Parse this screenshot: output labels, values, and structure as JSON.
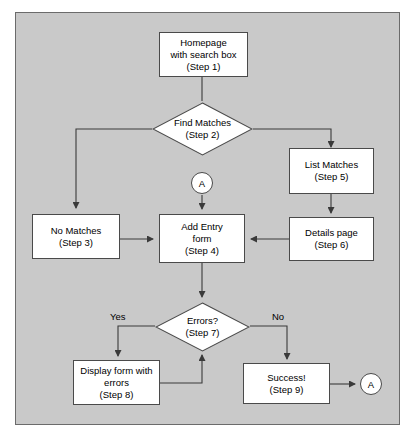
{
  "diagram": {
    "type": "flowchart",
    "background_color": "#c9c9c9",
    "node_fill_color": "#ffffff",
    "node_border_color": "#4a4a4a",
    "line_color": "#4a4a4a"
  },
  "nodes": {
    "homepage": {
      "shape": "process",
      "line1": "Homepage",
      "line2": "with search box",
      "line3": "(Step 1)"
    },
    "find_matches": {
      "shape": "decision",
      "line1": "Find Matches",
      "line2": "(Step 2)"
    },
    "connector_in": {
      "shape": "connector",
      "label": "A"
    },
    "list_matches": {
      "shape": "process",
      "line1": "List Matches",
      "line2": "(Step 5)"
    },
    "details_page": {
      "shape": "process",
      "line1": "Details page",
      "line2": "(Step 6)"
    },
    "no_matches": {
      "shape": "process",
      "line1": "No Matches",
      "line2": "(Step 3)"
    },
    "add_entry": {
      "shape": "process",
      "line1": "Add Entry",
      "line2": "form",
      "line3": "(Step 4)"
    },
    "errors": {
      "shape": "decision",
      "line1": "Errors?",
      "line2": "(Step 7)"
    },
    "display_form": {
      "shape": "process",
      "line1": "Display form with",
      "line2": "errors",
      "line3": "(Step 8)"
    },
    "success": {
      "shape": "process",
      "line1": "Success!",
      "line2": "(Step 9)"
    },
    "connector_out": {
      "shape": "connector",
      "label": "A"
    }
  },
  "edge_labels": {
    "errors_yes": "Yes",
    "errors_no": "No"
  }
}
